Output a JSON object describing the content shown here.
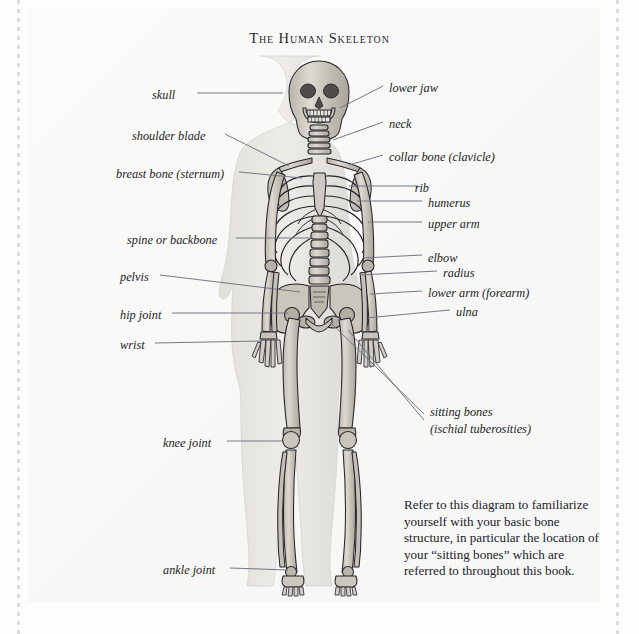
{
  "page": {
    "title": "The Human Skeleton",
    "background_color": "#f7f7f6",
    "frame": "perforated-dotted-border"
  },
  "figure": {
    "name": "human-skeleton-anterior-view",
    "colors": {
      "bone_fill": "#d8d4cb",
      "bone_shade": "#a9a49a",
      "bone_outline": "#23232a",
      "body_silhouette": "#e2e1dc",
      "leader_line": "#70707e"
    }
  },
  "labels_left": [
    {
      "text": "skull",
      "x": 152,
      "y": 95,
      "line_from_x": 197,
      "line_to_x": 283,
      "line_y": 93
    },
    {
      "text": "shoulder blade",
      "x": 132,
      "y": 137,
      "line_from_x": 225,
      "line_to_x": 289,
      "line_y": 134,
      "line_to_y": 163
    },
    {
      "text": "breast bone (sternum)",
      "x": 116,
      "y": 174,
      "line_from_x": 239,
      "line_to_x": 300,
      "line_y": 172
    },
    {
      "text": "spine or backbone",
      "x": 127,
      "y": 240,
      "line_from_x": 236,
      "line_to_x": 316,
      "line_y": 238
    },
    {
      "text": "pelvis",
      "x": 120,
      "y": 277,
      "line_from_x": 160,
      "line_to_x": 299,
      "line_y": 275
    },
    {
      "text": "hip joint",
      "x": 120,
      "y": 315,
      "line_from_x": 172,
      "line_to_x": 293,
      "line_y": 313
    },
    {
      "text": "wrist",
      "x": 120,
      "y": 345,
      "line_from_x": 155,
      "line_to_x": 241,
      "line_y": 343
    },
    {
      "text": "knee joint",
      "x": 163,
      "y": 443,
      "line_from_x": 227,
      "line_to_x": 289,
      "line_y": 441
    },
    {
      "text": "ankle joint",
      "x": 163,
      "y": 570,
      "line_from_x": 230,
      "line_to_x": 292,
      "line_y": 568
    }
  ],
  "labels_right": [
    {
      "text": "lower jaw",
      "x": 389,
      "y": 88,
      "line_from_x": 356,
      "line_to_x": 383,
      "line_y": 86,
      "line_from_y": 102
    },
    {
      "text": "neck",
      "x": 389,
      "y": 124,
      "line_from_x": 350,
      "line_to_x": 383,
      "line_y": 122,
      "line_from_y": 135
    },
    {
      "text": "collar bone (clavicle)",
      "x": 389,
      "y": 157,
      "line_from_x": 350,
      "line_to_x": 383,
      "line_y": 155
    },
    {
      "text": "rib",
      "x": 424,
      "y": 188,
      "line_from_x": 349,
      "line_to_x": 418,
      "line_y": 186,
      "align": "right"
    },
    {
      "text": "humerus",
      "x": 428,
      "y": 203,
      "line_from_x": 357,
      "line_to_x": 422,
      "line_y": 201
    },
    {
      "text": "upper arm",
      "x": 428,
      "y": 224,
      "line_from_x": 368,
      "line_to_x": 422,
      "line_y": 222
    },
    {
      "text": "elbow",
      "x": 428,
      "y": 258,
      "line_from_x": 363,
      "line_to_x": 422,
      "line_y": 256
    },
    {
      "text": "radius",
      "x": 443,
      "y": 273,
      "line_from_x": 360,
      "line_to_x": 437,
      "line_y": 271
    },
    {
      "text": "lower arm (forearm)",
      "x": 428,
      "y": 293,
      "line_from_x": 370,
      "line_to_x": 422,
      "line_y": 291
    },
    {
      "text": "ulna",
      "x": 456,
      "y": 312,
      "line_from_x": 366,
      "line_to_x": 450,
      "line_y": 310
    }
  ],
  "callout": {
    "line1": "sitting bones",
    "line2": "(ischial tuberosities)",
    "x": 430,
    "y": 412,
    "leader_lines": [
      {
        "from_x": 330,
        "from_y": 322,
        "to_x": 424,
        "to_y": 414
      },
      {
        "from_x": 348,
        "from_y": 330,
        "to_x": 424,
        "to_y": 420
      }
    ]
  },
  "note": {
    "text": "Refer to this diagram to familiarize yourself with your basic bone structure, in particular the location of your “sitting bones” which are referred to throughout this book."
  }
}
